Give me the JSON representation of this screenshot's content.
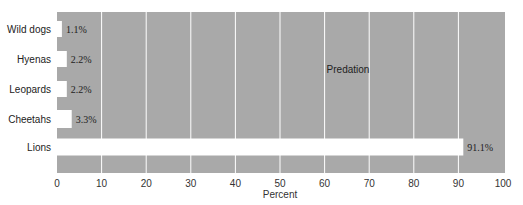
{
  "chart_data": {
    "type": "bar",
    "orientation": "horizontal",
    "title": "",
    "xlabel": "Percent",
    "ylabel": "",
    "xlim": [
      0,
      100
    ],
    "xticks": [
      0,
      10,
      20,
      30,
      40,
      50,
      60,
      70,
      80,
      90,
      100
    ],
    "grid": true,
    "categories": [
      "Wild dogs",
      "Hyenas",
      "Leopards",
      "Cheetahs",
      "Lions"
    ],
    "values": [
      1.1,
      2.2,
      2.2,
      3.3,
      91.1
    ],
    "data_labels": [
      "1.1%",
      "2.2%",
      "2.2%",
      "3.3%",
      "91.1%"
    ],
    "annotation": "Predation",
    "colors": {
      "background": "#a9a9a9",
      "bar": "#ffffff",
      "grid": "#ffffff"
    }
  }
}
